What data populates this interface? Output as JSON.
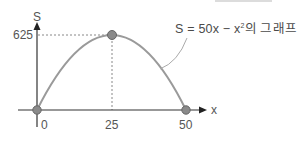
{
  "figure": {
    "axes": {
      "x_label": "x",
      "y_label": "S"
    },
    "ticks": {
      "y_max": "625",
      "x_origin": "0",
      "x_vertex": "25",
      "x_root": "50"
    },
    "annotation": {
      "eq_prefix": "S = 50x − x",
      "eq_exp": "2",
      "eq_suffix": "의 그래프"
    },
    "points": [
      {
        "name": "origin",
        "x": 0,
        "s": 0
      },
      {
        "name": "vertex",
        "x": 25,
        "s": 625
      },
      {
        "name": "root",
        "x": 50,
        "s": 0
      }
    ],
    "colors": {
      "curve": "#9a9a9a",
      "axis": "#333333",
      "point_fill": "#8a8a8a",
      "point_stroke": "#666666",
      "guide": "#888888",
      "text": "#555555"
    }
  }
}
